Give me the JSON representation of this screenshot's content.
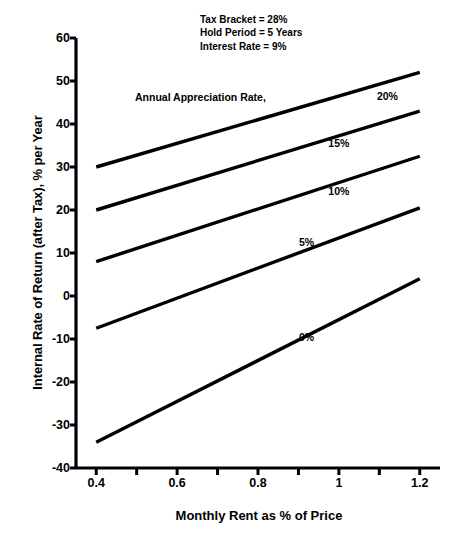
{
  "chart_data": {
    "type": "line",
    "title": "",
    "xlabel": "Monthly Rent as % of Price",
    "ylabel": "Internal Rate of Return (after Tax), % per Year",
    "xlim": [
      0.35,
      1.25
    ],
    "ylim": [
      -40,
      60
    ],
    "xticks": [
      0.4,
      0.6,
      0.8,
      1.0,
      1.2
    ],
    "xtick_labels": [
      "0.4",
      "0.6",
      "0.8",
      "1",
      "1.2"
    ],
    "xminor_step": 0.1,
    "yticks": [
      -40,
      -30,
      -20,
      -10,
      0,
      10,
      20,
      30,
      40,
      50,
      60
    ],
    "ytick_labels": [
      "-40",
      "-30",
      "-20",
      "-10",
      "0",
      "10",
      "20",
      "30",
      "40",
      "50",
      "60"
    ],
    "grid": false,
    "legend_position": "inline-right-of-lines",
    "legend_title": "Annual Appreciation Rate,",
    "line_color": "#000000",
    "series": [
      {
        "name": "20%",
        "label": "20%",
        "x": [
          0.4,
          1.2
        ],
        "values": [
          30,
          52
        ],
        "label_at": {
          "x": 1.12,
          "y": 46.5
        }
      },
      {
        "name": "15%",
        "label": "15%",
        "x": [
          0.4,
          1.2
        ],
        "values": [
          20,
          43
        ],
        "label_at": {
          "x": 1.0,
          "y": 35.5
        }
      },
      {
        "name": "10%",
        "label": "10%",
        "x": [
          0.4,
          1.2
        ],
        "values": [
          8,
          32.5
        ],
        "label_at": {
          "x": 1.0,
          "y": 24.5
        }
      },
      {
        "name": "5%",
        "label": "5%",
        "x": [
          0.4,
          1.2
        ],
        "values": [
          -7.5,
          20.5
        ],
        "label_at": {
          "x": 0.92,
          "y": 12.5
        }
      },
      {
        "name": "0%",
        "label": "0%",
        "x": [
          0.4,
          1.2
        ],
        "values": [
          -34,
          4
        ],
        "label_at": {
          "x": 0.92,
          "y": -9.5
        }
      }
    ],
    "annotations": [
      "Tax Bracket = 28%",
      "Hold Period = 5 Years",
      "Interest Rate = 9%"
    ]
  }
}
